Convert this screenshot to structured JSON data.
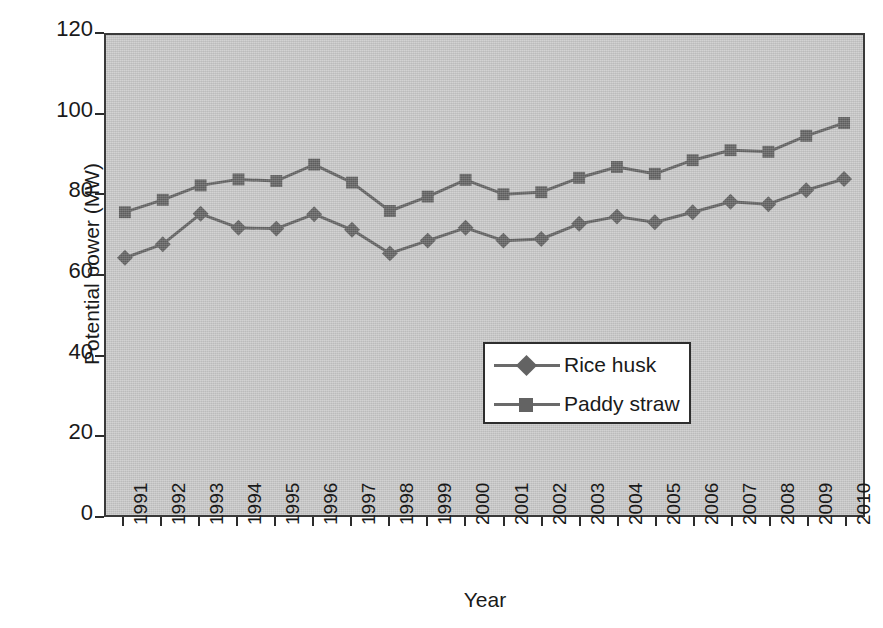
{
  "chart_data": {
    "type": "line",
    "title": "",
    "xlabel": "Year",
    "ylabel": "Potential power (MW)",
    "categories": [
      "1991",
      "1992",
      "1993",
      "1994",
      "1995",
      "1996",
      "1997",
      "1998",
      "1999",
      "2000",
      "2001",
      "2002",
      "2003",
      "2004",
      "2005",
      "2006",
      "2007",
      "2008",
      "2009",
      "2010"
    ],
    "ylim": [
      0,
      120
    ],
    "yticks": [
      0,
      20,
      40,
      60,
      80,
      100,
      120
    ],
    "grid": false,
    "legend_position": "center",
    "plot_background": "#c9c9c9",
    "series": [
      {
        "name": "Rice husk",
        "marker": "diamond",
        "color": "#636363",
        "values": [
          64.3,
          67.7,
          75.3,
          71.8,
          71.6,
          75.2,
          71.3,
          65.4,
          68.6,
          71.8,
          68.6,
          69.0,
          72.8,
          74.6,
          73.2,
          75.7,
          78.3,
          77.7,
          81.2,
          84.0
        ]
      },
      {
        "name": "Paddy straw",
        "marker": "square",
        "color": "#636363",
        "values": [
          75.7,
          78.8,
          82.4,
          83.9,
          83.5,
          87.6,
          83.1,
          76.0,
          79.6,
          83.8,
          80.2,
          80.7,
          84.3,
          87.0,
          85.3,
          88.7,
          91.2,
          90.8,
          94.8,
          98.0
        ]
      }
    ]
  },
  "axes": {
    "y_tick_labels": [
      "120",
      "100",
      "80",
      "60",
      "40",
      "20",
      "0"
    ],
    "x_tick_labels": [
      "1991",
      "1992",
      "1993",
      "1994",
      "1995",
      "1996",
      "1997",
      "1998",
      "1999",
      "2000",
      "2001",
      "2002",
      "2003",
      "2004",
      "2005",
      "2006",
      "2007",
      "2008",
      "2009",
      "2010"
    ]
  },
  "legend": {
    "entries": [
      {
        "label": "Rice husk",
        "marker": "diamond-marker-icon"
      },
      {
        "label": "Paddy straw",
        "marker": "square-marker-icon"
      }
    ]
  }
}
